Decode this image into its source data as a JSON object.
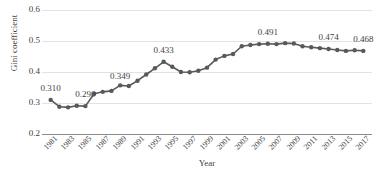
{
  "chart_data": {
    "type": "line",
    "title": "",
    "xlabel": "Year",
    "ylabel": "Gini coefficient",
    "ylim": [
      0.2,
      0.6
    ],
    "yticks": [
      0.2,
      0.3,
      0.4,
      0.5,
      0.6
    ],
    "ytick_labels": [
      "0.2",
      "0.3",
      "0.4",
      "0.5",
      "0.6"
    ],
    "xlim": [
      1980,
      2018
    ],
    "xticks": [
      1981,
      1983,
      1985,
      1987,
      1989,
      1991,
      1993,
      1995,
      1997,
      1999,
      2001,
      2003,
      2005,
      2007,
      2009,
      2011,
      2013,
      2015,
      2017
    ],
    "xtick_labels": [
      "1981",
      "1983",
      "1985",
      "1987",
      "1989",
      "1991",
      "1993",
      "1995",
      "1997",
      "1999",
      "2001",
      "2003",
      "2005",
      "2007",
      "2009",
      "2011",
      "2013",
      "2015",
      "2017"
    ],
    "grid": true,
    "legend": false,
    "marker": "circle",
    "line_color": "#595959",
    "marker_color": "#595959",
    "grid_color": "#e2e2e2",
    "axis_color": "#8a8a8a",
    "x": [
      1981,
      1982,
      1983,
      1984,
      1985,
      1986,
      1987,
      1988,
      1989,
      1990,
      1991,
      1992,
      1993,
      1994,
      1995,
      1996,
      1997,
      1998,
      1999,
      2000,
      2001,
      2002,
      2003,
      2004,
      2005,
      2006,
      2007,
      2008,
      2009,
      2010,
      2011,
      2012,
      2013,
      2014,
      2015,
      2016,
      2017
    ],
    "values": [
      0.31,
      0.288,
      0.286,
      0.291,
      0.29,
      0.33,
      0.336,
      0.339,
      0.357,
      0.355,
      0.372,
      0.392,
      0.412,
      0.433,
      0.417,
      0.4,
      0.399,
      0.404,
      0.414,
      0.44,
      0.452,
      0.458,
      0.483,
      0.487,
      0.49,
      0.491,
      0.49,
      0.493,
      0.492,
      0.483,
      0.48,
      0.477,
      0.474,
      0.471,
      0.468,
      0.47,
      0.468
    ],
    "annotations": [
      {
        "year": 1981,
        "value": 0.31,
        "label": "0.310"
      },
      {
        "year": 1985,
        "value": 0.29,
        "label": "0.290"
      },
      {
        "year": 1989,
        "value": 0.349,
        "label": "0.349"
      },
      {
        "year": 1994,
        "value": 0.433,
        "label": "0.433"
      },
      {
        "year": 2006,
        "value": 0.491,
        "label": "0.491"
      },
      {
        "year": 2013,
        "value": 0.474,
        "label": "0.474"
      },
      {
        "year": 2017,
        "value": 0.468,
        "label": "0.468"
      }
    ]
  }
}
